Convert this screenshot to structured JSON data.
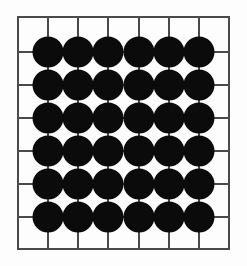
{
  "figure": {
    "background_color": "#fdfdfd"
  },
  "board": {
    "name": "grid-board",
    "line_color": "#4a4a4a",
    "border_color": "#4a4a4a",
    "line_width": 1.6,
    "left": 18,
    "top": 17,
    "right": 229,
    "bottom": 249,
    "columns": 7,
    "rows": 7,
    "vertical_line_count": 8,
    "horizontal_line_count": 8,
    "vertical_lines_x": [
      18,
      48,
      78,
      108,
      139,
      169,
      199,
      229
    ],
    "horizontal_lines_y": [
      17,
      52,
      85,
      118,
      151,
      184,
      217,
      249
    ]
  },
  "stones": {
    "name": "black-stones",
    "color": "#0b0b0b",
    "radius": 15.5,
    "count": 36,
    "grid_columns": 6,
    "grid_rows": 6,
    "centers_x": [
      48,
      78,
      108,
      139,
      169,
      199
    ],
    "centers_y": [
      52,
      85,
      118,
      151,
      184,
      217
    ],
    "positions": [
      {
        "col": 0,
        "row": 0,
        "cx": 48,
        "cy": 52
      },
      {
        "col": 1,
        "row": 0,
        "cx": 78,
        "cy": 52
      },
      {
        "col": 2,
        "row": 0,
        "cx": 108,
        "cy": 52
      },
      {
        "col": 3,
        "row": 0,
        "cx": 139,
        "cy": 52
      },
      {
        "col": 4,
        "row": 0,
        "cx": 169,
        "cy": 52
      },
      {
        "col": 5,
        "row": 0,
        "cx": 199,
        "cy": 52
      },
      {
        "col": 0,
        "row": 1,
        "cx": 48,
        "cy": 85
      },
      {
        "col": 1,
        "row": 1,
        "cx": 78,
        "cy": 85
      },
      {
        "col": 2,
        "row": 1,
        "cx": 108,
        "cy": 85
      },
      {
        "col": 3,
        "row": 1,
        "cx": 139,
        "cy": 85
      },
      {
        "col": 4,
        "row": 1,
        "cx": 169,
        "cy": 85
      },
      {
        "col": 5,
        "row": 1,
        "cx": 199,
        "cy": 85
      },
      {
        "col": 0,
        "row": 2,
        "cx": 48,
        "cy": 118
      },
      {
        "col": 1,
        "row": 2,
        "cx": 78,
        "cy": 118
      },
      {
        "col": 2,
        "row": 2,
        "cx": 108,
        "cy": 118
      },
      {
        "col": 3,
        "row": 2,
        "cx": 139,
        "cy": 118
      },
      {
        "col": 4,
        "row": 2,
        "cx": 169,
        "cy": 118
      },
      {
        "col": 5,
        "row": 2,
        "cx": 199,
        "cy": 118
      },
      {
        "col": 0,
        "row": 3,
        "cx": 48,
        "cy": 151
      },
      {
        "col": 1,
        "row": 3,
        "cx": 78,
        "cy": 151
      },
      {
        "col": 2,
        "row": 3,
        "cx": 108,
        "cy": 151
      },
      {
        "col": 3,
        "row": 3,
        "cx": 139,
        "cy": 151
      },
      {
        "col": 4,
        "row": 3,
        "cx": 169,
        "cy": 151
      },
      {
        "col": 5,
        "row": 3,
        "cx": 199,
        "cy": 151
      },
      {
        "col": 0,
        "row": 4,
        "cx": 48,
        "cy": 184
      },
      {
        "col": 1,
        "row": 4,
        "cx": 78,
        "cy": 184
      },
      {
        "col": 2,
        "row": 4,
        "cx": 108,
        "cy": 184
      },
      {
        "col": 3,
        "row": 4,
        "cx": 139,
        "cy": 184
      },
      {
        "col": 4,
        "row": 4,
        "cx": 169,
        "cy": 184
      },
      {
        "col": 5,
        "row": 4,
        "cx": 199,
        "cy": 184
      },
      {
        "col": 0,
        "row": 5,
        "cx": 48,
        "cy": 217
      },
      {
        "col": 1,
        "row": 5,
        "cx": 78,
        "cy": 217
      },
      {
        "col": 2,
        "row": 5,
        "cx": 108,
        "cy": 217
      },
      {
        "col": 3,
        "row": 5,
        "cx": 139,
        "cy": 217
      },
      {
        "col": 4,
        "row": 5,
        "cx": 169,
        "cy": 217
      },
      {
        "col": 5,
        "row": 5,
        "cx": 199,
        "cy": 217
      }
    ]
  }
}
